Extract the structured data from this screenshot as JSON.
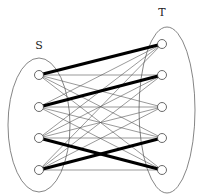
{
  "diagram": {
    "type": "bipartite-graph",
    "sets": [
      {
        "id": "S",
        "label": "S",
        "label_pos": [
          39,
          49
        ],
        "ellipse": {
          "cx": 39,
          "cy": 125,
          "rx": 31,
          "ry": 67
        }
      },
      {
        "id": "T",
        "label": "T",
        "label_pos": [
          162,
          16
        ],
        "ellipse": {
          "cx": 167,
          "cy": 110,
          "rx": 28,
          "ry": 83
        }
      }
    ],
    "nodes": {
      "S": [
        {
          "id": "s1",
          "x": 39,
          "y": 75
        },
        {
          "id": "s2",
          "x": 39,
          "y": 107
        },
        {
          "id": "s3",
          "x": 39,
          "y": 138
        },
        {
          "id": "s4",
          "x": 39,
          "y": 170
        }
      ],
      "T": [
        {
          "id": "t1",
          "x": 162,
          "y": 44
        },
        {
          "id": "t2",
          "x": 162,
          "y": 75
        },
        {
          "id": "t3",
          "x": 162,
          "y": 107
        },
        {
          "id": "t4",
          "x": 162,
          "y": 138
        },
        {
          "id": "t5",
          "x": 162,
          "y": 170
        }
      ]
    },
    "complete_bipartite_thin_edges": true,
    "matching_edges": [
      {
        "from": "s1",
        "to": "t1"
      },
      {
        "from": "s2",
        "to": "t2"
      },
      {
        "from": "s3",
        "to": "t5"
      },
      {
        "from": "s4",
        "to": "t4"
      }
    ],
    "colors": {
      "thin_edge": "#555555",
      "thick_edge": "#000000",
      "ellipse": "#666666",
      "node_fill": "#ffffff",
      "node_stroke": "#444444"
    }
  }
}
